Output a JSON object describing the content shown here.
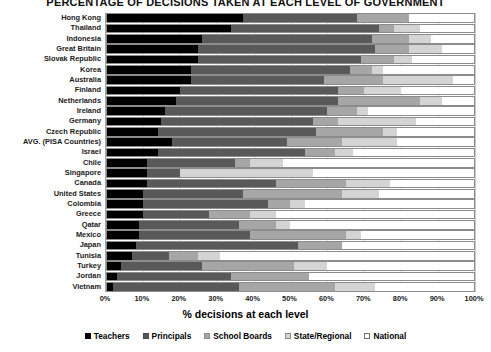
{
  "chart": {
    "title": "PERCENTAGE OF DECISIONS TAKEN AT EACH LEVEL OF GOVERNMENT",
    "xlabel": "% decisions at each level",
    "ylabel": ""
  },
  "xticks": [
    "0%",
    "10%",
    "20%",
    "30%",
    "40%",
    "50%",
    "60%",
    "70%",
    "80%",
    "90%",
    "100%"
  ],
  "legend": [
    {
      "label": "Teachers",
      "color": "#000000"
    },
    {
      "label": "Principals",
      "color": "#595959"
    },
    {
      "label": "School Boards",
      "color": "#a6a6a6"
    },
    {
      "label": "State/Regional",
      "color": "#d4d4d4"
    },
    {
      "label": "National",
      "color": "#ffffff"
    }
  ],
  "chart_data": {
    "type": "bar",
    "orientation": "horizontal",
    "stacked": true,
    "title": "PERCENTAGE OF DECISIONS TAKEN AT EACH LEVEL OF GOVERNMENT",
    "xlabel": "% decisions at each level",
    "ylabel": "",
    "xlim": [
      0,
      100
    ],
    "grid": true,
    "legend_position": "bottom",
    "categories": [
      "Hong Kong",
      "Thailand",
      "Indonesia",
      "Great Britain",
      "Slovak Republic",
      "Korea",
      "Australia",
      "Finland",
      "Netherlands",
      "Ireland",
      "Germany",
      "Czech Republic",
      "AVG. (PISA Countries)",
      "Israel",
      "Chile",
      "Singapore",
      "Canada",
      "United States",
      "Colombia",
      "Greece",
      "Qatar",
      "Mexico",
      "Japan",
      "Tunisia",
      "Turkey",
      "Jordan",
      "Vietnam"
    ],
    "series": [
      {
        "name": "Teachers",
        "color": "#000000",
        "values": [
          37,
          34,
          26,
          25,
          25,
          23,
          23,
          20,
          19,
          16,
          15,
          14,
          18,
          14,
          11,
          11,
          11,
          10,
          10,
          10,
          9,
          9,
          8,
          7,
          4,
          3,
          2
        ]
      },
      {
        "name": "Principals",
        "color": "#595959",
        "values": [
          31,
          40,
          46,
          48,
          44,
          43,
          36,
          43,
          44,
          44,
          41,
          43,
          31,
          40,
          24,
          9,
          35,
          27,
          34,
          18,
          27,
          30,
          44,
          10,
          22,
          31,
          34
        ]
      },
      {
        "name": "School Boards",
        "color": "#a6a6a6",
        "values": [
          14,
          4,
          10,
          9,
          9,
          6,
          16,
          7,
          22,
          8,
          7,
          18,
          15,
          8,
          4,
          0,
          19,
          27,
          6,
          11,
          10,
          26,
          12,
          8,
          25,
          21,
          26
        ]
      },
      {
        "name": "State/Regional",
        "color": "#d4d4d4",
        "values": [
          0,
          7,
          6,
          9,
          5,
          3,
          19,
          10,
          6,
          3,
          21,
          4,
          15,
          5,
          9,
          36,
          12,
          10,
          4,
          7,
          4,
          4,
          0,
          6,
          9,
          0,
          11
        ]
      },
      {
        "name": "National",
        "color": "#ffffff",
        "values": [
          18,
          15,
          12,
          9,
          17,
          25,
          6,
          20,
          9,
          29,
          16,
          21,
          21,
          33,
          52,
          44,
          23,
          26,
          46,
          54,
          50,
          31,
          36,
          69,
          40,
          45,
          27
        ]
      }
    ]
  }
}
